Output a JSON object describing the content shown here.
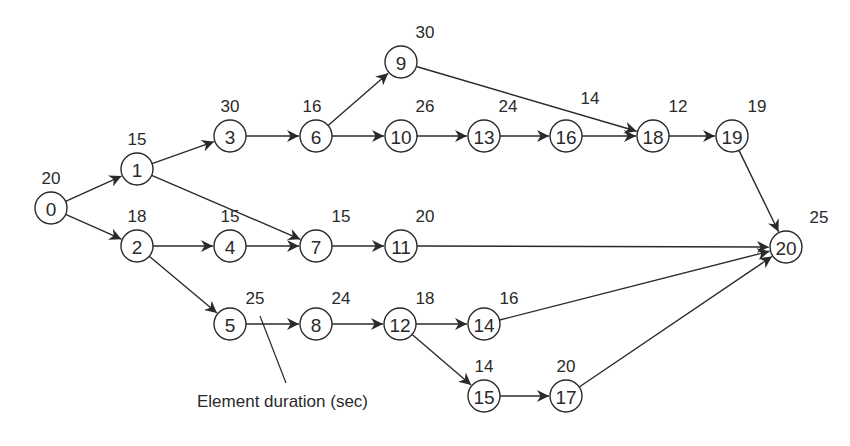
{
  "diagram": {
    "type": "precedence-network",
    "node_radius": 16,
    "colors": {
      "stroke": "#2a2a2a",
      "background": "#ffffff",
      "text": "#2a2a2a"
    },
    "nodes": [
      {
        "id": "0",
        "label": "0",
        "duration": "20",
        "x": 51,
        "y": 208,
        "dx": 0,
        "dy": -24
      },
      {
        "id": "1",
        "label": "1",
        "duration": "15",
        "x": 137,
        "y": 169,
        "dx": 0,
        "dy": -24
      },
      {
        "id": "2",
        "label": "2",
        "duration": "18",
        "x": 137,
        "y": 246,
        "dx": 0,
        "dy": -24
      },
      {
        "id": "3",
        "label": "3",
        "duration": "30",
        "x": 230,
        "y": 136,
        "dx": 0,
        "dy": -24
      },
      {
        "id": "4",
        "label": "4",
        "duration": "15",
        "x": 230,
        "y": 246,
        "dx": 0,
        "dy": -24
      },
      {
        "id": "5",
        "label": "5",
        "duration": "25",
        "x": 230,
        "y": 324,
        "dx": 25,
        "dy": -20
      },
      {
        "id": "6",
        "label": "6",
        "duration": "16",
        "x": 316,
        "y": 136,
        "dx": -4,
        "dy": -24
      },
      {
        "id": "7",
        "label": "7",
        "duration": "15",
        "x": 316,
        "y": 246,
        "dx": 25,
        "dy": -24
      },
      {
        "id": "8",
        "label": "8",
        "duration": "24",
        "x": 316,
        "y": 324,
        "dx": 25,
        "dy": -20
      },
      {
        "id": "9",
        "label": "9",
        "duration": "30",
        "x": 401,
        "y": 62,
        "dx": 24,
        "dy": -24
      },
      {
        "id": "10",
        "label": "10",
        "duration": "26",
        "x": 401,
        "y": 136,
        "dx": 24,
        "dy": -24
      },
      {
        "id": "11",
        "label": "11",
        "duration": "20",
        "x": 401,
        "y": 246,
        "dx": 24,
        "dy": -24
      },
      {
        "id": "12",
        "label": "12",
        "duration": "18",
        "x": 400,
        "y": 324,
        "dx": 25,
        "dy": -20
      },
      {
        "id": "13",
        "label": "13",
        "duration": "24",
        "x": 484,
        "y": 136,
        "dx": 24,
        "dy": -24
      },
      {
        "id": "14",
        "label": "14",
        "duration": "16",
        "x": 484,
        "y": 324,
        "dx": 25,
        "dy": -20
      },
      {
        "id": "15",
        "label": "15",
        "duration": "14",
        "x": 484,
        "y": 396,
        "dx": 0,
        "dy": -24
      },
      {
        "id": "16",
        "label": "16",
        "duration": "14",
        "x": 566,
        "y": 136,
        "dx": 24,
        "dy": -32
      },
      {
        "id": "17",
        "label": "17",
        "duration": "20",
        "x": 566,
        "y": 396,
        "dx": 0,
        "dy": -24
      },
      {
        "id": "18",
        "label": "18",
        "duration": "12",
        "x": 653,
        "y": 136,
        "dx": 25,
        "dy": -24
      },
      {
        "id": "19",
        "label": "19",
        "duration": "19",
        "x": 732,
        "y": 136,
        "dx": 25,
        "dy": -24
      },
      {
        "id": "20",
        "label": "20",
        "duration": "25",
        "x": 786,
        "y": 247,
        "dx": 33,
        "dy": -24
      }
    ],
    "edges": [
      [
        "0",
        "1"
      ],
      [
        "0",
        "2"
      ],
      [
        "1",
        "3"
      ],
      [
        "1",
        "7"
      ],
      [
        "2",
        "4"
      ],
      [
        "2",
        "5"
      ],
      [
        "3",
        "6"
      ],
      [
        "4",
        "7"
      ],
      [
        "5",
        "8"
      ],
      [
        "6",
        "9"
      ],
      [
        "6",
        "10"
      ],
      [
        "7",
        "11"
      ],
      [
        "8",
        "12"
      ],
      [
        "9",
        "18"
      ],
      [
        "10",
        "13"
      ],
      [
        "11",
        "20"
      ],
      [
        "12",
        "14"
      ],
      [
        "12",
        "15"
      ],
      [
        "13",
        "16"
      ],
      [
        "14",
        "20"
      ],
      [
        "15",
        "17"
      ],
      [
        "16",
        "18"
      ],
      [
        "17",
        "20"
      ],
      [
        "18",
        "19"
      ],
      [
        "19",
        "20"
      ]
    ],
    "callout": {
      "text": "Element duration (sec)",
      "text_x": 197,
      "text_y": 407,
      "line_from": [
        260,
        316
      ],
      "line_to": [
        286,
        383
      ]
    }
  }
}
